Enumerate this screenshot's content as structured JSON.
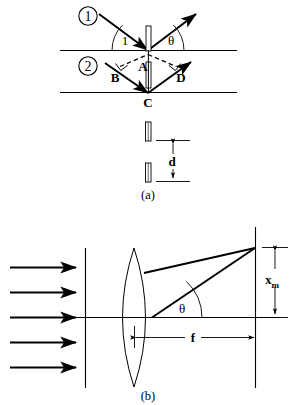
{
  "figure": {
    "stroke_color": "#000000",
    "background_color": "#ffffff",
    "panels": [
      {
        "id": "panel-a",
        "caption": "(a)",
        "description": "Two parallel X-ray beams reflecting from adjacent atomic planes of a crystal, showing path difference BC + CD and slit separation d",
        "ray_labels": [
          {
            "name": "ray-1-label",
            "text": "1"
          },
          {
            "name": "ray-2-label",
            "text": "2"
          }
        ],
        "angle_labels": [
          {
            "name": "incident-angle-label",
            "text": "1"
          },
          {
            "name": "reflection-angle-label",
            "text": "θ"
          }
        ],
        "point_labels": [
          {
            "name": "point-a-label",
            "text": "A"
          },
          {
            "name": "point-b-label",
            "text": "B"
          },
          {
            "name": "point-c-label",
            "text": "C"
          },
          {
            "name": "point-d-label",
            "text": "D"
          }
        ],
        "dimension_labels": [
          {
            "name": "slit-separation-label",
            "text": "d"
          }
        ],
        "plane_count": 2,
        "slit_count": 2
      },
      {
        "id": "panel-b",
        "caption": "(b)",
        "description": "Collimated plane wave incident on a converging lens, focused to a point at height x sub m on the screen a focal distance f away",
        "angle_labels": [
          {
            "name": "diffraction-angle-label",
            "text": "θ"
          }
        ],
        "dimension_labels": [
          {
            "name": "focal-length-label",
            "text": "f"
          },
          {
            "name": "spot-height-label-base",
            "text": "x"
          },
          {
            "name": "spot-height-label-subscript",
            "text": "m"
          }
        ],
        "incoming_ray_count": 5
      }
    ]
  }
}
